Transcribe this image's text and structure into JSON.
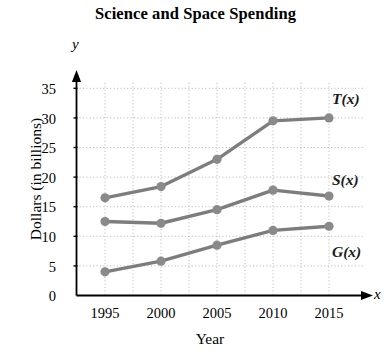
{
  "chart_data": {
    "type": "line",
    "title": "Science and Space Spending",
    "xlabel": "Year",
    "ylabel": "Dollars (in billions)",
    "x": [
      1995,
      2000,
      2005,
      2010,
      2015
    ],
    "xtick_labels": [
      "1995",
      "2000",
      "2005",
      "2010",
      "2015"
    ],
    "ytick_labels": [
      "0",
      "5",
      "10",
      "15",
      "20",
      "25",
      "30",
      "35"
    ],
    "yticks": [
      0,
      5,
      10,
      15,
      20,
      25,
      30,
      35
    ],
    "xlim": [
      1993.5,
      2016.5
    ],
    "ylim": [
      0,
      36.5
    ],
    "grid": true,
    "grid_style": "dotted",
    "legend": "inline-labels-right",
    "axis_letter_x": "x",
    "axis_letter_y": "y",
    "line_color": "#7d7d7d",
    "marker_color": "#8a8a8a",
    "axis_color": "#000000",
    "grid_color": "#b9b9b9",
    "series": [
      {
        "name": "T(x)",
        "label": "T(x)",
        "values": [
          16.5,
          18.4,
          23.0,
          29.5,
          30.0
        ]
      },
      {
        "name": "S(x)",
        "label": "S(x)",
        "values": [
          12.5,
          12.2,
          14.5,
          17.8,
          16.8
        ]
      },
      {
        "name": "G(x)",
        "label": "G(x)",
        "values": [
          4.0,
          5.8,
          8.5,
          11.0,
          11.7
        ]
      }
    ]
  }
}
